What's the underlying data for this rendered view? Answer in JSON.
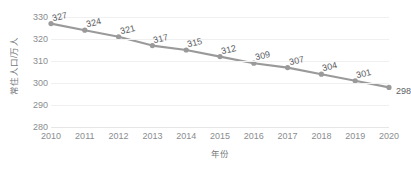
{
  "chart_data": {
    "type": "line",
    "title": "",
    "xlabel": "年份",
    "ylabel": "常住人口/万人",
    "categories": [
      "2010",
      "2011",
      "2012",
      "2013",
      "2014",
      "2015",
      "2016",
      "2017",
      "2018",
      "2019",
      "2020"
    ],
    "values": [
      327,
      324,
      321,
      317,
      315,
      312,
      309,
      307,
      304,
      301,
      298
    ],
    "series": [
      {
        "name": "常住人口",
        "values": [
          327,
          324,
          321,
          317,
          315,
          312,
          309,
          307,
          304,
          301,
          298
        ]
      }
    ],
    "data_labels": [
      "327",
      "324",
      "321",
      "317",
      "315",
      "312",
      "309",
      "307",
      "304",
      "301",
      "298"
    ],
    "ylim": [
      280,
      330
    ],
    "yticks": [
      280,
      290,
      300,
      310,
      320,
      330
    ],
    "ytick_labels": [
      "280",
      "290",
      "300",
      "310",
      "320",
      "330"
    ],
    "xlim": [
      "2010",
      "2020"
    ],
    "grid": true,
    "grid_axis": "y",
    "legend": false,
    "legend_position": "none",
    "marker": "circle",
    "colors": {
      "line": "#9a9a9a",
      "marker": "#9a9a9a",
      "gridline": "#f0f0f0",
      "baseline": "#e6e6e6",
      "tick_text": "#8a8d90",
      "axis_title": "#777b7e",
      "data_label": "#5d6164",
      "background": "#ffffff"
    }
  }
}
